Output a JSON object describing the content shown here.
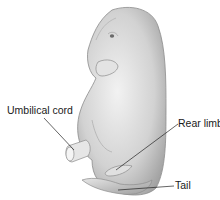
{
  "diagram": {
    "labels": [
      {
        "id": "umbilical-cord",
        "text": "Umbilical cord"
      },
      {
        "id": "rear-limb",
        "text": "Rear limb"
      },
      {
        "id": "tail",
        "text": "Tail"
      }
    ]
  }
}
